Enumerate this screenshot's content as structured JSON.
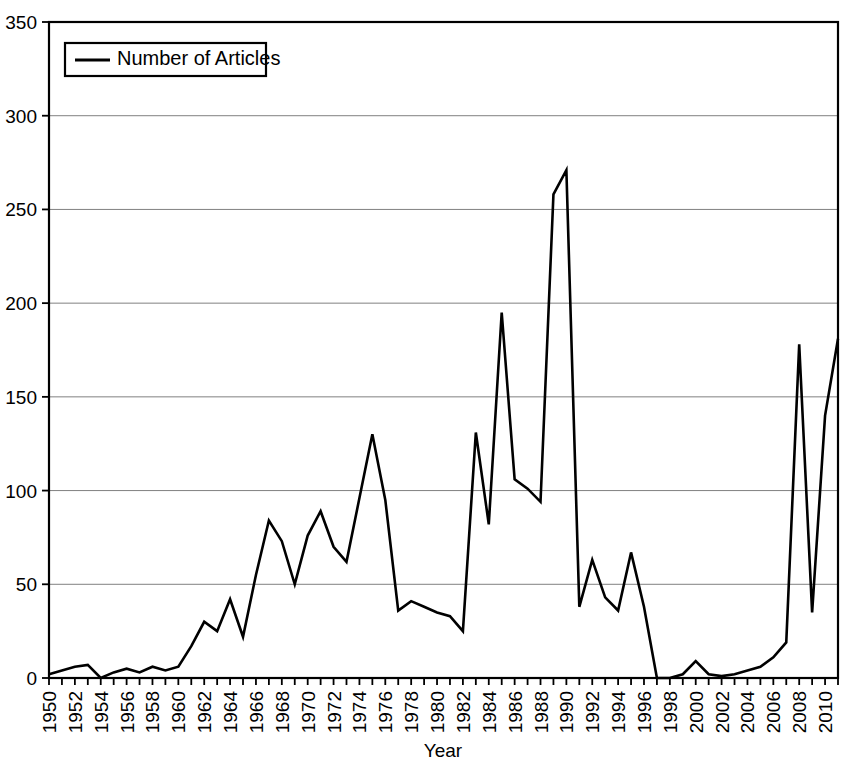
{
  "chart_data": {
    "type": "line",
    "title": "",
    "xlabel": "Year",
    "ylabel": "",
    "xlim": [
      1950,
      2011
    ],
    "ylim": [
      0,
      350
    ],
    "yticks": [
      0,
      50,
      100,
      150,
      200,
      250,
      300,
      350
    ],
    "xticks": [
      1950,
      1952,
      1954,
      1956,
      1958,
      1960,
      1962,
      1964,
      1966,
      1968,
      1970,
      1972,
      1974,
      1976,
      1978,
      1980,
      1982,
      1984,
      1986,
      1988,
      1990,
      1992,
      1994,
      1996,
      1998,
      2000,
      2002,
      2004,
      2006,
      2008,
      2010
    ],
    "grid": "horizontal",
    "legend_position": "top-left",
    "legend": [
      "Number of Articles"
    ],
    "series": [
      {
        "name": "Number of Articles",
        "color": "#000000",
        "x": [
          1950,
          1951,
          1952,
          1953,
          1954,
          1955,
          1956,
          1957,
          1958,
          1959,
          1960,
          1961,
          1962,
          1963,
          1964,
          1965,
          1966,
          1967,
          1968,
          1969,
          1970,
          1971,
          1972,
          1973,
          1974,
          1975,
          1976,
          1977,
          1978,
          1979,
          1980,
          1981,
          1982,
          1983,
          1984,
          1985,
          1986,
          1987,
          1988,
          1989,
          1990,
          1991,
          1992,
          1993,
          1994,
          1995,
          1996,
          1997,
          1998,
          1999,
          2000,
          2001,
          2002,
          2003,
          2004,
          2005,
          2006,
          2007,
          2008,
          2009,
          2010,
          2011
        ],
        "values": [
          2,
          4,
          6,
          7,
          0,
          3,
          5,
          3,
          6,
          4,
          6,
          17,
          30,
          25,
          42,
          22,
          55,
          84,
          73,
          50,
          76,
          89,
          70,
          62,
          96,
          130,
          95,
          36,
          41,
          38,
          35,
          33,
          25,
          131,
          82,
          195,
          106,
          101,
          94,
          258,
          271,
          38,
          63,
          43,
          36,
          67,
          38,
          0,
          0,
          2,
          9,
          2,
          1,
          2,
          4,
          6,
          11,
          19,
          178,
          35,
          140,
          181
        ]
      }
    ]
  },
  "axis": {
    "x_title": "Year"
  },
  "colors": {
    "line": "#000000",
    "grid": "#808080",
    "axis": "#000000",
    "background": "#ffffff"
  }
}
